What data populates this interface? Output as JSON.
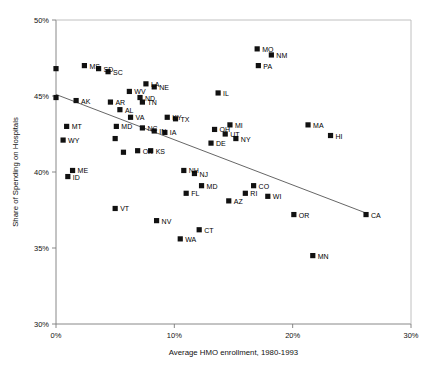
{
  "chart_data": {
    "type": "scatter",
    "title": "",
    "xlabel": "Average HMO enrollment, 1980-1993",
    "ylabel": "Share of Spending on Hospitals",
    "xlim": [
      0,
      30
    ],
    "ylim": [
      30,
      50
    ],
    "xticks": [
      "0%",
      "10%",
      "20%",
      "30%"
    ],
    "xtick_values": [
      0,
      10,
      20,
      30
    ],
    "yticks": [
      "30%",
      "35%",
      "40%",
      "45%",
      "50%"
    ],
    "ytick_values": [
      30,
      35,
      40,
      45,
      50
    ],
    "grid": false,
    "legend": "none",
    "trendline": {
      "label": "fitted regression line",
      "x1": 0.0,
      "y1": 45.1,
      "x2": 26.2,
      "y2": 37.3
    },
    "points": [
      {
        "label": "",
        "x": 0.0,
        "y": 46.8
      },
      {
        "label": "",
        "x": 0.0,
        "y": 44.9
      },
      {
        "label": "MS",
        "x": 2.4,
        "y": 47.0
      },
      {
        "label": "SD",
        "x": 3.6,
        "y": 46.8
      },
      {
        "label": "SC",
        "x": 4.4,
        "y": 46.6
      },
      {
        "label": "MO",
        "x": 17.0,
        "y": 48.1
      },
      {
        "label": "NM",
        "x": 18.2,
        "y": 47.7
      },
      {
        "label": "PA",
        "x": 17.1,
        "y": 47.0
      },
      {
        "label": "LA",
        "x": 7.6,
        "y": 45.8
      },
      {
        "label": "NE",
        "x": 8.3,
        "y": 45.6
      },
      {
        "label": "WV",
        "x": 6.2,
        "y": 45.3
      },
      {
        "label": "ND",
        "x": 7.1,
        "y": 44.9
      },
      {
        "label": "TN",
        "x": 7.3,
        "y": 44.6
      },
      {
        "label": "AK",
        "x": 1.7,
        "y": 44.7
      },
      {
        "label": "AR",
        "x": 4.6,
        "y": 44.6
      },
      {
        "label": "AL",
        "x": 5.4,
        "y": 44.1
      },
      {
        "label": "IL",
        "x": 13.7,
        "y": 45.2
      },
      {
        "label": "MT",
        "x": 0.9,
        "y": 43.0
      },
      {
        "label": "WY",
        "x": 0.6,
        "y": 42.1
      },
      {
        "label": "MA",
        "x": 21.3,
        "y": 43.1
      },
      {
        "label": "HI",
        "x": 23.2,
        "y": 42.4
      },
      {
        "label": "MI",
        "x": 14.7,
        "y": 43.1
      },
      {
        "label": "OH",
        "x": 13.4,
        "y": 42.8
      },
      {
        "label": "UT",
        "x": 14.3,
        "y": 42.5
      },
      {
        "label": "NY",
        "x": 15.2,
        "y": 42.2
      },
      {
        "label": "DE",
        "x": 13.1,
        "y": 41.9
      },
      {
        "label": "KY",
        "x": 9.4,
        "y": 43.6
      },
      {
        "label": "TX",
        "x": 10.1,
        "y": 43.5
      },
      {
        "label": "VA",
        "x": 6.3,
        "y": 43.6
      },
      {
        "label": "NC",
        "x": 7.3,
        "y": 42.9
      },
      {
        "label": "IN",
        "x": 8.3,
        "y": 42.7
      },
      {
        "label": "IA",
        "x": 9.2,
        "y": 42.6
      },
      {
        "label": "MD2",
        "x": 5.1,
        "y": 43.0
      },
      {
        "label": "",
        "x": 5.0,
        "y": 42.2
      },
      {
        "label": "OK",
        "x": 6.9,
        "y": 41.4
      },
      {
        "label": "KS",
        "x": 8.0,
        "y": 41.4
      },
      {
        "label": "",
        "x": 5.7,
        "y": 41.3
      },
      {
        "label": "ME",
        "x": 1.4,
        "y": 40.1
      },
      {
        "label": "ID",
        "x": 1.0,
        "y": 39.7
      },
      {
        "label": "NH",
        "x": 10.8,
        "y": 40.1
      },
      {
        "label": "NJ",
        "x": 11.7,
        "y": 39.9
      },
      {
        "label": "MD",
        "x": 12.3,
        "y": 39.1
      },
      {
        "label": "CO",
        "x": 16.7,
        "y": 39.1
      },
      {
        "label": "FL",
        "x": 11.0,
        "y": 38.6
      },
      {
        "label": "RI",
        "x": 16.0,
        "y": 38.6
      },
      {
        "label": "WI",
        "x": 17.9,
        "y": 38.4
      },
      {
        "label": "AZ",
        "x": 14.6,
        "y": 38.1
      },
      {
        "label": "VT",
        "x": 5.0,
        "y": 37.6
      },
      {
        "label": "NV",
        "x": 8.5,
        "y": 36.8
      },
      {
        "label": "OR",
        "x": 20.1,
        "y": 37.2
      },
      {
        "label": "CA",
        "x": 26.2,
        "y": 37.2
      },
      {
        "label": "CT",
        "x": 12.1,
        "y": 36.2
      },
      {
        "label": "WA",
        "x": 10.5,
        "y": 35.6
      },
      {
        "label": "MN",
        "x": 21.7,
        "y": 34.5
      }
    ]
  }
}
